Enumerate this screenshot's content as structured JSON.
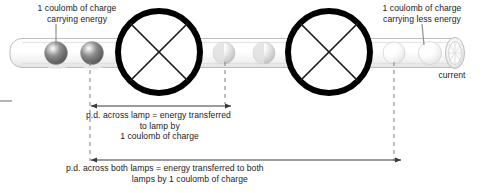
{
  "diagram": {
    "labels": {
      "charge_energy": "1 coulomb of charge\ncarrying energy",
      "charge_less_energy": "1 coulomb of charge\ncarrying less energy",
      "current": "current",
      "pd_across_lamp": "p.d. across lamp = energy transferred\n                      to lamp by\n              1 coulomb of charge",
      "pd_across_both_lamps": "p.d. across both lamps = energy transferred to both\n                           lamps by 1 coulomb of charge"
    },
    "colors": {
      "ink": "#1b1b1b",
      "wire_outline": "#b9b9b9",
      "wire_fill": "#fcfcfc",
      "lamp_stroke": "#000000",
      "dash": "#8a8a8a",
      "arrow": "#3a3a3a",
      "charge_dark": "#6e6e6e",
      "charge_mid": "#d6d6d6",
      "charge_light": "#f2f2f2"
    },
    "wire": {
      "x": 10,
      "y": 38,
      "width": 452,
      "height": 30,
      "end_cap_label": "cylinder-open-end"
    },
    "charges": [
      {
        "name": "charge-1",
        "cx": 56,
        "cy": 53,
        "r": 11.5,
        "shade": "dark",
        "energy_state": "carrying energy"
      },
      {
        "name": "charge-2",
        "cx": 92,
        "cy": 53,
        "r": 11.5,
        "shade": "dark",
        "energy_state": "carrying energy"
      },
      {
        "name": "charge-3",
        "cx": 224,
        "cy": 53,
        "r": 11.0,
        "shade": "mid",
        "energy_state": "reduced energy"
      },
      {
        "name": "charge-4",
        "cx": 264,
        "cy": 53,
        "r": 11.0,
        "shade": "mid",
        "energy_state": "reduced energy"
      },
      {
        "name": "charge-5",
        "cx": 394,
        "cy": 53,
        "r": 11.0,
        "shade": "light",
        "energy_state": "carrying less energy"
      },
      {
        "name": "charge-6",
        "cx": 430,
        "cy": 53,
        "r": 11.5,
        "shade": "light",
        "energy_state": "carrying less energy"
      }
    ],
    "lamps": [
      {
        "name": "lamp-1",
        "cx": 159,
        "cy": 52,
        "r": 41,
        "stroke_width": 6,
        "symbol": "circle-with-cross"
      },
      {
        "name": "lamp-2",
        "cx": 329,
        "cy": 52,
        "r": 41,
        "stroke_width": 6,
        "symbol": "circle-with-cross"
      }
    ],
    "dashed_guides": [
      {
        "name": "guide-left",
        "x": 90,
        "y1": 62,
        "y2": 161
      },
      {
        "name": "guide-middle",
        "x": 225,
        "y1": 62,
        "y2": 104
      },
      {
        "name": "guide-right",
        "x": 394,
        "y1": 62,
        "y2": 161
      }
    ],
    "measure_arrows": [
      {
        "name": "pd-lamp-arrow",
        "x1": 90,
        "x2": 225,
        "y": 106,
        "style": "double-headed"
      },
      {
        "name": "pd-both-arrow",
        "x1": 90,
        "x2": 395,
        "y": 160,
        "style": "double-headed"
      }
    ],
    "leader_lines": [
      {
        "name": "leader-charge-energy",
        "x1": 56,
        "y1": 24,
        "x2": 56,
        "y2": 45
      },
      {
        "name": "leader-charge-less",
        "x1": 422,
        "y1": 24,
        "x2": 424,
        "y2": 45
      }
    ],
    "left_tick": {
      "name": "left-edge-tick",
      "x1": 0,
      "x2": 12,
      "y": 101
    }
  }
}
